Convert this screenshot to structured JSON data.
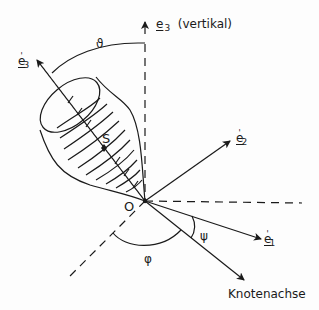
{
  "diagram": {
    "type": "euler-angles-rigid-body",
    "labels": {
      "e3": {
        "base": "e",
        "sub": "3",
        "note": "(vertikal)"
      },
      "e3_prime": {
        "base": "e",
        "prime": "'",
        "sub": "3"
      },
      "e2_prime": {
        "base": "e",
        "prime": "'",
        "sub": "2"
      },
      "e1_prime": {
        "base": "e",
        "prime": "'",
        "sub": "1"
      },
      "theta": "ϑ",
      "phi": "φ",
      "psi": "ψ",
      "origin": "O",
      "center_of_mass": "S",
      "node_axis": "Knotenachse"
    },
    "colors": {
      "line": "#1a1a1a",
      "background": "#fdfdfd"
    }
  }
}
